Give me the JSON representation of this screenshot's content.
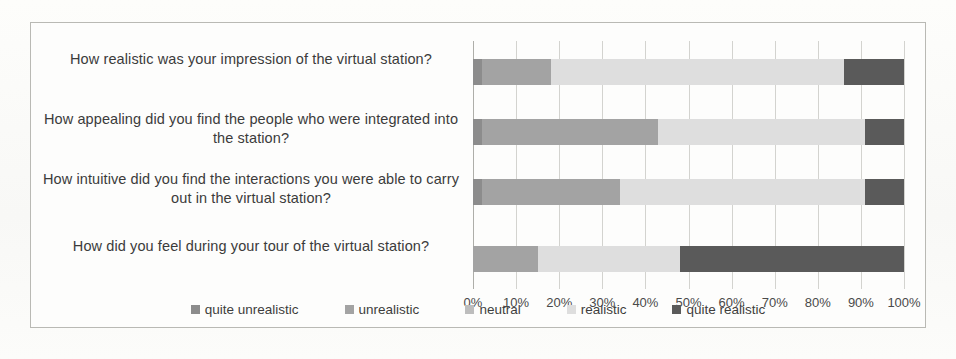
{
  "chart_data": {
    "type": "bar",
    "orientation": "horizontal",
    "stacked": true,
    "normalized": "100%",
    "title": "",
    "xlabel": "",
    "ylabel": "",
    "xlim": [
      0,
      100
    ],
    "grid": true,
    "legend_position": "bottom",
    "tick_labels": [
      "0%",
      "10%",
      "20%",
      "30%",
      "40%",
      "50%",
      "60%",
      "70%",
      "80%",
      "90%",
      "100%"
    ],
    "tick_values": [
      0,
      10,
      20,
      30,
      40,
      50,
      60,
      70,
      80,
      90,
      100
    ],
    "categories": [
      "How realistic was your impression of the virtual station?",
      "How appealing did you find the people who were integrated into the station?",
      "How intuitive did you find the interactions you were able to carry out in the virtual station?",
      "How did you feel during your tour of the virtual station?"
    ],
    "series": [
      {
        "name": "quite unrealistic",
        "color": "#8c8c8c",
        "values": [
          2,
          2,
          2,
          0
        ]
      },
      {
        "name": "unrealistic",
        "color": "#a3a3a3",
        "values": [
          16,
          41,
          32,
          15
        ]
      },
      {
        "name": "neutral",
        "color": "#bdbdbd",
        "values": [
          0,
          0,
          0,
          0
        ]
      },
      {
        "name": "realistic",
        "color": "#dedede",
        "values": [
          68,
          48,
          57,
          33
        ]
      },
      {
        "name": "quite realistic",
        "color": "#5a5a5a",
        "values": [
          14,
          9,
          9,
          52
        ]
      }
    ]
  },
  "legend": {
    "items": [
      {
        "label": "quite unrealistic",
        "color": "#8c8c8c"
      },
      {
        "label": "unrealistic",
        "color": "#a3a3a3"
      },
      {
        "label": "neutral",
        "color": "#bdbdbd"
      },
      {
        "label": "realistic",
        "color": "#dedede"
      },
      {
        "label": "quite realistic",
        "color": "#5a5a5a"
      }
    ]
  }
}
